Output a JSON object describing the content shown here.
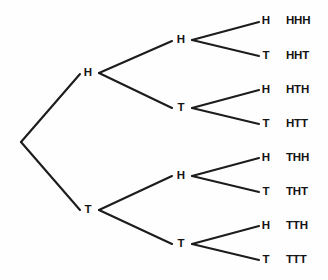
{
  "figure": {
    "type": "tree-diagram",
    "background_color": "#fefefe",
    "line_color": "#1c1c1c",
    "text_color": "#131313"
  },
  "tree_data": {
    "type": "tree",
    "description": "Three-stage coin flip probability tree showing all eight equally likely outcomes",
    "depth": 3,
    "branch_labels": [
      "H",
      "T"
    ],
    "root": {
      "name": "root",
      "label": "",
      "x": 21,
      "y": 142
    },
    "level1": [
      {
        "name": "level1-h",
        "label": "H",
        "x": 88,
        "y": 73,
        "vertex_x": 99
      },
      {
        "name": "level1-t",
        "label": "T",
        "x": 88,
        "y": 210,
        "vertex_x": 99
      }
    ],
    "level2": [
      {
        "name": "level2-hh",
        "label": "H",
        "x": 181,
        "y": 40,
        "vertex_x": 192
      },
      {
        "name": "level2-ht",
        "label": "T",
        "x": 181,
        "y": 108,
        "vertex_x": 192
      },
      {
        "name": "level2-th",
        "label": "H",
        "x": 181,
        "y": 176,
        "vertex_x": 192
      },
      {
        "name": "level2-tt",
        "label": "T",
        "x": 181,
        "y": 244,
        "vertex_x": 192
      }
    ],
    "leaves": [
      {
        "name": "leaf-hhh",
        "flip": "H",
        "outcome": "HHH",
        "x": 266,
        "y": 21,
        "outcome_x": 286
      },
      {
        "name": "leaf-hht",
        "flip": "T",
        "outcome": "HHT",
        "x": 266,
        "y": 56,
        "outcome_x": 286
      },
      {
        "name": "leaf-hth",
        "flip": "H",
        "outcome": "HTH",
        "x": 266,
        "y": 90,
        "outcome_x": 286
      },
      {
        "name": "leaf-htt",
        "flip": "T",
        "outcome": "HTT",
        "x": 266,
        "y": 124,
        "outcome_x": 286
      },
      {
        "name": "leaf-thh",
        "flip": "H",
        "outcome": "THH",
        "x": 266,
        "y": 158,
        "outcome_x": 286
      },
      {
        "name": "leaf-tht",
        "flip": "T",
        "outcome": "THT",
        "x": 266,
        "y": 192,
        "outcome_x": 286
      },
      {
        "name": "leaf-tth",
        "flip": "H",
        "outcome": "TTH",
        "x": 266,
        "y": 226,
        "outcome_x": 286
      },
      {
        "name": "leaf-ttt",
        "flip": "T",
        "outcome": "TTT",
        "x": 266,
        "y": 260,
        "outcome_x": 286
      }
    ],
    "edges": [
      {
        "name": "edge-root-h",
        "x1": 21,
        "y1": 142,
        "x2": 80,
        "y2": 74
      },
      {
        "name": "edge-root-t",
        "x1": 21,
        "y1": 142,
        "x2": 80,
        "y2": 210
      },
      {
        "name": "edge-h-hh",
        "x1": 99,
        "y1": 73,
        "x2": 172,
        "y2": 41
      },
      {
        "name": "edge-h-ht",
        "x1": 99,
        "y1": 73,
        "x2": 172,
        "y2": 108
      },
      {
        "name": "edge-t-th",
        "x1": 99,
        "y1": 210,
        "x2": 172,
        "y2": 176
      },
      {
        "name": "edge-t-tt",
        "x1": 99,
        "y1": 210,
        "x2": 172,
        "y2": 244
      },
      {
        "name": "edge-hh-hhh",
        "x1": 192,
        "y1": 40,
        "x2": 259,
        "y2": 22
      },
      {
        "name": "edge-hh-hht",
        "x1": 192,
        "y1": 40,
        "x2": 259,
        "y2": 56
      },
      {
        "name": "edge-ht-hth",
        "x1": 192,
        "y1": 108,
        "x2": 259,
        "y2": 90
      },
      {
        "name": "edge-ht-htt",
        "x1": 192,
        "y1": 108,
        "x2": 259,
        "y2": 124
      },
      {
        "name": "edge-th-thh",
        "x1": 192,
        "y1": 176,
        "x2": 259,
        "y2": 158
      },
      {
        "name": "edge-th-tht",
        "x1": 192,
        "y1": 176,
        "x2": 259,
        "y2": 192
      },
      {
        "name": "edge-tt-tth",
        "x1": 192,
        "y1": 244,
        "x2": 259,
        "y2": 226
      },
      {
        "name": "edge-tt-ttt",
        "x1": 192,
        "y1": 244,
        "x2": 259,
        "y2": 260
      }
    ]
  }
}
